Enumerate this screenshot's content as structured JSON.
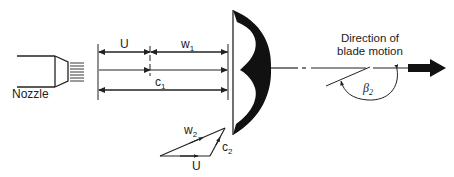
{
  "diagram": {
    "type": "impulse turbine blade velocity diagram",
    "labels": {
      "nozzle": "Nozzle",
      "u_top": "U",
      "w1": "w",
      "w1_sub": "1",
      "c1": "c",
      "c1_sub": "1",
      "w2": "w",
      "w2_sub": "2",
      "c2": "c",
      "c2_sub": "2",
      "u_bottom": "U",
      "direction_line1": "Direction of",
      "direction_line2": "blade motion",
      "beta": "β",
      "beta_sub": "2"
    },
    "colors": {
      "ink": "#222222",
      "background": "#ffffff"
    }
  }
}
